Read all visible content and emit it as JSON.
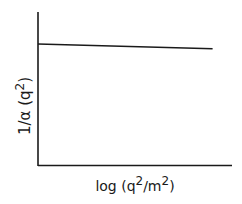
{
  "chart_data": {
    "type": "line",
    "title": "",
    "xlabel": "log (q²/m²)",
    "ylabel": "1/α (q²)",
    "xlabel_parts": {
      "base": "log (q",
      "sup1": "2",
      "mid": "/m",
      "sup2": "2",
      "end": ")"
    },
    "ylabel_parts": {
      "base": "1/α (q",
      "sup": "2",
      "end": ")"
    },
    "x_ticks": [],
    "y_ticks": [],
    "grid": false,
    "legend": null,
    "xlim": [
      0,
      1
    ],
    "ylim": [
      0,
      1
    ],
    "series": [
      {
        "name": "1/α(q²)",
        "x": [
          0.0,
          0.9
        ],
        "y": [
          0.79,
          0.76
        ],
        "color": "#1a1a1a",
        "style": "solid"
      }
    ],
    "annotations": []
  },
  "colors": {
    "axis": "#1a1a1a",
    "line": "#1a1a1a",
    "background": "#ffffff"
  }
}
